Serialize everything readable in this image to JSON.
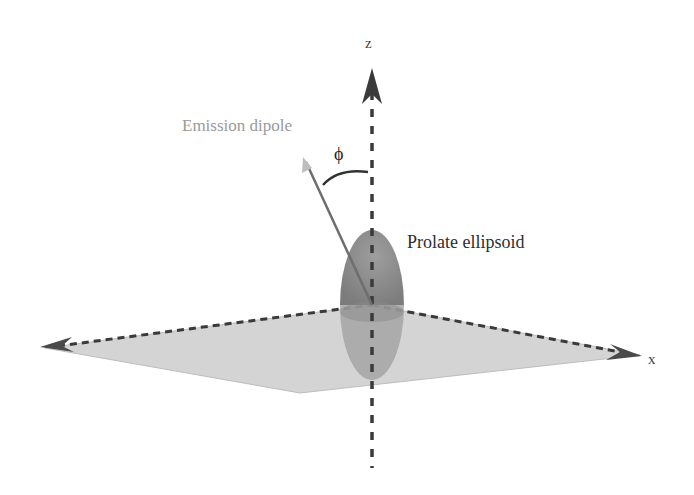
{
  "diagram": {
    "labels": {
      "z_axis": "z",
      "x_axis": "x",
      "angle": "ϕ",
      "dipole": "Emission dipole",
      "ellipsoid": "Prolate ellipsoid"
    },
    "colors": {
      "plane_fill": "#d4d4d4",
      "ellipsoid_upper": "#8a8a8a",
      "ellipsoid_lower": "#a8a8a8",
      "axis_dash": "#444444",
      "dipole_line": "#777777",
      "dipole_label": "#9a9a9a",
      "ellipsoid_label": "#2e2e2e"
    },
    "elements": [
      "horizontal plane (x-y plane) with dashed edges",
      "vertical dashed z axis with arrowhead",
      "dashed x axis with arrowheads on both ends",
      "prolate ellipsoid centered at origin, elongated along z",
      "emission dipole vector tilted from z axis",
      "angle phi arc between dipole and z axis"
    ]
  }
}
